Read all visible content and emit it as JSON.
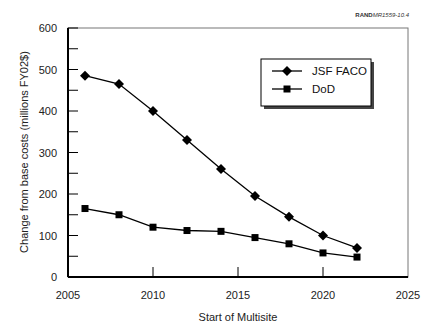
{
  "credit": {
    "org": "RAND",
    "ref": "MR1559-10.4"
  },
  "chart_data": {
    "type": "line",
    "title": "",
    "xlabel": "Start of Multisite",
    "ylabel": "Change from base costs (millions FY02$)",
    "xlim": [
      2005,
      2025
    ],
    "ylim": [
      0,
      600
    ],
    "xticks": [
      2005,
      2010,
      2015,
      2020,
      2025
    ],
    "yticks": [
      0,
      100,
      200,
      300,
      400,
      500,
      600
    ],
    "grid": false,
    "legend_position": "upper right (inset box)",
    "x": [
      2006,
      2008,
      2010,
      2012,
      2014,
      2016,
      2018,
      2020,
      2022
    ],
    "series": [
      {
        "name": "JSF FACO",
        "marker": "diamond",
        "values": [
          485,
          465,
          400,
          330,
          260,
          195,
          145,
          100,
          70
        ]
      },
      {
        "name": "DoD",
        "marker": "square",
        "values": [
          165,
          150,
          120,
          112,
          110,
          95,
          80,
          58,
          48
        ]
      }
    ]
  },
  "legend": {
    "items": [
      "JSF FACO",
      "DoD"
    ]
  }
}
